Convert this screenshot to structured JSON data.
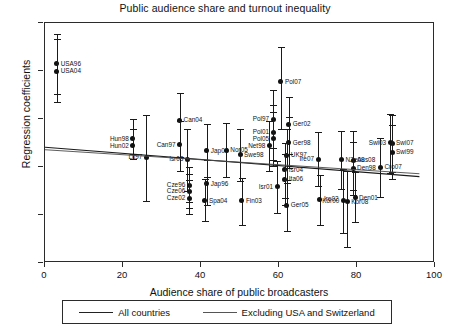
{
  "chart_data": {
    "type": "scatter",
    "title": "Public audience share and turnout inequality",
    "xlabel": "Audience share of public broadcasters",
    "ylabel": "Regression coefficients",
    "xlim": [
      0,
      100
    ],
    "ylim": [
      -0.2,
      0.8
    ],
    "xticks": [
      0,
      20,
      40,
      60,
      80,
      100
    ],
    "xticklabels": [
      "0",
      "20",
      "40",
      "60",
      "80",
      "100"
    ],
    "yticks": [
      -0.2,
      0,
      0.2,
      0.4,
      0.6,
      0.8
    ],
    "yticklabels": [
      "-.2",
      "0",
      ".2",
      ".4",
      ".6",
      ".8"
    ],
    "grid": false,
    "legend_position": "below",
    "error_bars": "vertical 95% confidence intervals",
    "legend": [
      {
        "label": "All countries",
        "style": "solid"
      },
      {
        "label": "Excluding USA and Switzerland",
        "style": "solid-thin"
      }
    ],
    "series": [
      {
        "name": "Country-year estimates",
        "points": [
          {
            "label": "USA96",
            "x": 3.0,
            "y": 0.63,
            "lo": 0.505,
            "hi": 0.755,
            "side": "right"
          },
          {
            "label": "USA04",
            "x": 3.0,
            "y": 0.6,
            "lo": 0.47,
            "hi": 0.735,
            "side": "right"
          },
          {
            "label": "Hun98",
            "x": 22.5,
            "y": 0.318,
            "lo": 0.255,
            "hi": 0.398,
            "side": "left"
          },
          {
            "label": "Hun02",
            "x": 22.5,
            "y": 0.288,
            "lo": 0.232,
            "hi": 0.36,
            "side": "left"
          },
          {
            "label": "Lit97",
            "x": 26.0,
            "y": 0.24,
            "lo": 0.06,
            "hi": 0.415,
            "side": "left"
          },
          {
            "label": "Can04",
            "x": 34.5,
            "y": 0.395,
            "lo": 0.24,
            "hi": 0.51,
            "side": "right"
          },
          {
            "label": "Can97",
            "x": 34.5,
            "y": 0.292,
            "lo": 0.185,
            "hi": 0.39,
            "side": "left"
          },
          {
            "label": "Isr03",
            "x": 36.5,
            "y": 0.232,
            "lo": 0.1,
            "hi": 0.36,
            "side": "left"
          },
          {
            "label": "Cze96",
            "x": 37.0,
            "y": 0.125,
            "lo": 0.055,
            "hi": 0.2,
            "side": "left"
          },
          {
            "label": "Cze06",
            "x": 37.0,
            "y": 0.098,
            "lo": 0.03,
            "hi": 0.17,
            "side": "left"
          },
          {
            "label": "Cze02",
            "x": 37.0,
            "y": 0.07,
            "lo": 0.005,
            "hi": 0.145,
            "side": "left"
          },
          {
            "label": "Jap04",
            "x": 41.5,
            "y": 0.268,
            "lo": 0.16,
            "hi": 0.38,
            "side": "right"
          },
          {
            "label": "Jap96",
            "x": 41.5,
            "y": 0.13,
            "lo": 0.04,
            "hi": 0.23,
            "side": "right"
          },
          {
            "label": "Spa04",
            "x": 41.0,
            "y": 0.06,
            "lo": -0.025,
            "hi": 0.15,
            "side": "right"
          },
          {
            "label": "Nor05",
            "x": 46.5,
            "y": 0.27,
            "lo": 0.16,
            "hi": 0.385,
            "side": "right"
          },
          {
            "label": "Swe98",
            "x": 50.0,
            "y": 0.252,
            "lo": 0.14,
            "hi": 0.36,
            "side": "right"
          },
          {
            "label": "Fin03",
            "x": 50.5,
            "y": 0.06,
            "lo": -0.04,
            "hi": 0.155,
            "side": "right"
          },
          {
            "label": "Pol07",
            "x": 60.5,
            "y": 0.555,
            "lo": 0.36,
            "hi": 0.7,
            "side": "right"
          },
          {
            "label": "Pol97",
            "x": 58.5,
            "y": 0.4,
            "lo": 0.28,
            "hi": 0.52,
            "side": "left"
          },
          {
            "label": "Pol01",
            "x": 58.5,
            "y": 0.345,
            "lo": 0.23,
            "hi": 0.46,
            "side": "left"
          },
          {
            "label": "Pol05",
            "x": 58.5,
            "y": 0.318,
            "lo": 0.205,
            "hi": 0.43,
            "side": "left"
          },
          {
            "label": "Net98",
            "x": 57.5,
            "y": 0.288,
            "lo": 0.185,
            "hi": 0.39,
            "side": "left"
          },
          {
            "label": "Ger02",
            "x": 62.5,
            "y": 0.378,
            "lo": 0.255,
            "hi": 0.49,
            "side": "right"
          },
          {
            "label": "Ger98",
            "x": 62.5,
            "y": 0.302,
            "lo": 0.195,
            "hi": 0.41,
            "side": "right"
          },
          {
            "label": "UK97",
            "x": 62.0,
            "y": 0.248,
            "lo": 0.135,
            "hi": 0.36,
            "side": "right"
          },
          {
            "label": "Isr04",
            "x": 61.5,
            "y": 0.188,
            "lo": 0.07,
            "hi": 0.3,
            "side": "right"
          },
          {
            "label": "Ita06",
            "x": 61.5,
            "y": 0.148,
            "lo": 0.04,
            "hi": 0.255,
            "side": "right"
          },
          {
            "label": "Isr01",
            "x": 59.5,
            "y": 0.118,
            "lo": 0.01,
            "hi": 0.225,
            "side": "left"
          },
          {
            "label": "Ger05",
            "x": 62.0,
            "y": 0.04,
            "lo": -0.065,
            "hi": 0.145,
            "side": "right"
          },
          {
            "label": "Ire07",
            "x": 70.0,
            "y": 0.232,
            "lo": 0.12,
            "hi": 0.345,
            "side": "left"
          },
          {
            "label": "Ire02",
            "x": 70.5,
            "y": 0.065,
            "lo": -0.04,
            "hi": 0.165,
            "side": "right"
          },
          {
            "label": "NZe08",
            "x": 76.0,
            "y": 0.23,
            "lo": 0.11,
            "hi": 0.35,
            "side": "right"
          },
          {
            "label": "Aus08",
            "x": 79.0,
            "y": 0.228,
            "lo": 0.105,
            "hi": 0.35,
            "side": "right"
          },
          {
            "label": "Den98",
            "x": 79.0,
            "y": 0.195,
            "lo": 0.085,
            "hi": 0.305,
            "side": "right"
          },
          {
            "label": "Den01",
            "x": 79.5,
            "y": 0.072,
            "lo": -0.03,
            "hi": 0.178,
            "side": "right"
          },
          {
            "label": "Kor00",
            "x": 76.5,
            "y": 0.06,
            "lo": -0.075,
            "hi": 0.19,
            "side": "left"
          },
          {
            "label": "Kor08",
            "x": 77.5,
            "y": 0.055,
            "lo": -0.135,
            "hi": 0.185,
            "side": "right"
          },
          {
            "label": "Swi03",
            "x": 88.5,
            "y": 0.302,
            "lo": 0.175,
            "hi": 0.42,
            "side": "left"
          },
          {
            "label": "Swi07",
            "x": 89.0,
            "y": 0.3,
            "lo": 0.18,
            "hi": 0.418,
            "side": "right"
          },
          {
            "label": "Swi99",
            "x": 89.0,
            "y": 0.262,
            "lo": 0.15,
            "hi": 0.375,
            "side": "right"
          },
          {
            "label": "Cro07",
            "x": 86.0,
            "y": 0.2,
            "lo": 0.075,
            "hi": 0.32,
            "side": "right"
          }
        ]
      }
    ],
    "trendlines": [
      {
        "name": "All countries",
        "x0": 0,
        "y0": 0.282,
        "x1": 96,
        "y1": 0.16
      },
      {
        "name": "Excluding USA and Switzerland",
        "x0": 0,
        "y0": 0.272,
        "x1": 96,
        "y1": 0.172
      }
    ]
  }
}
